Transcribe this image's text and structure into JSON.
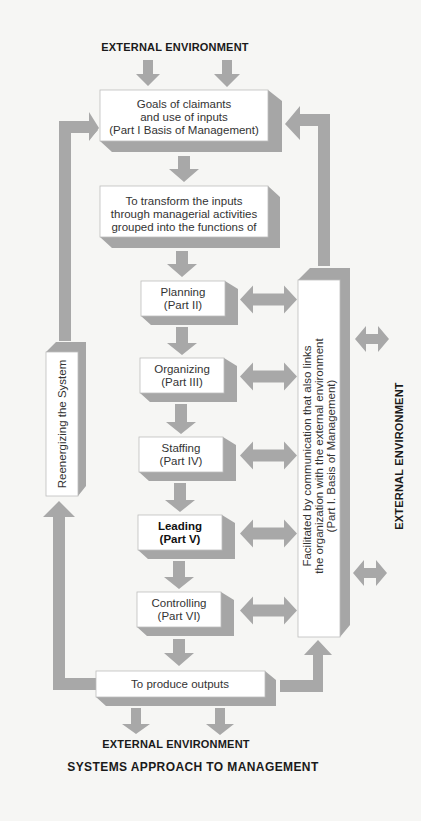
{
  "diagram": {
    "title": "SYSTEMS APPROACH TO MANAGEMENT",
    "external_top": "EXTERNAL ENVIRONMENT",
    "external_bottom": "EXTERNAL ENVIRONMENT",
    "external_right": "EXTERNAL ENVIRONMENT",
    "inputs_box": {
      "lines": [
        "Goals of claimants",
        "and use of inputs",
        "(Part I Basis of Management)"
      ]
    },
    "transform_box": {
      "lines": [
        "To transform the inputs",
        "through managerial activities",
        "grouped into the functions of"
      ]
    },
    "functions": [
      {
        "name": "Planning",
        "part": "(Part II)",
        "emphasized": false
      },
      {
        "name": "Organizing",
        "part": "(Part III)",
        "emphasized": false
      },
      {
        "name": "Staffing",
        "part": "(Part IV)",
        "emphasized": false
      },
      {
        "name": "Leading",
        "part": "(Part V)",
        "emphasized": true
      },
      {
        "name": "Controlling",
        "part": "(Part VI)",
        "emphasized": false
      }
    ],
    "outputs_box": {
      "label": "To produce outputs"
    },
    "reenergizing_box": {
      "label": "Reenergizing the System"
    },
    "communication_box": {
      "lines": [
        "Facilitated by communication that also links",
        "the organization with the external environment",
        "(Part I. Basis of Management)"
      ]
    },
    "colors": {
      "arrow": "#a8a8a8",
      "box_face": "#ffffff",
      "box_shadow": "#a6a6a6",
      "background": "#f6f6f4"
    }
  }
}
